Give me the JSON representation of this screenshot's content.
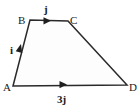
{
  "figure": {
    "background_color": "#ffffff",
    "stroke_color": "#2a2a2a",
    "fill_color": "#fdfdfd",
    "text_color": "#1b1b1b",
    "width": 140,
    "height": 105,
    "shape_type": "trapezium",
    "vertices": [
      {
        "id": "A",
        "label": "A",
        "x": 13,
        "y": 86,
        "label_x": 3,
        "label_y": 89
      },
      {
        "id": "B",
        "label": "B",
        "x": 30,
        "y": 20,
        "label_x": 18,
        "label_y": 22
      },
      {
        "id": "C",
        "label": "C",
        "x": 68,
        "y": 21,
        "label_x": 70,
        "label_y": 22
      },
      {
        "id": "D",
        "label": "D",
        "x": 127,
        "y": 85,
        "label_x": 129,
        "label_y": 89
      }
    ],
    "edges": [
      {
        "id": "AB",
        "from": "A",
        "to": "B",
        "vector_label": "i",
        "arrow": true,
        "label_x": 11,
        "label_y": 52
      },
      {
        "id": "BC",
        "from": "B",
        "to": "C",
        "vector_label": "j",
        "arrow": true,
        "label_x": 45,
        "label_y": 12
      },
      {
        "id": "CD",
        "from": "C",
        "to": "D",
        "vector_label": "",
        "arrow": false
      },
      {
        "id": "AD",
        "from": "A",
        "to": "D",
        "vector_label": "3j",
        "arrow": true,
        "label_x": 58,
        "label_y": 101
      }
    ],
    "arrow_markers": [
      {
        "id": "arrow-on-ab",
        "edge": "AB",
        "x": 20,
        "y": 49,
        "angle": -75
      },
      {
        "id": "arrow-on-bc",
        "edge": "BC",
        "x": 47,
        "y": 21,
        "angle": 0
      },
      {
        "id": "arrow-on-ad",
        "edge": "AD",
        "x": 63,
        "y": 84,
        "angle": 0
      }
    ],
    "path_outline": "M 13 86 L 30 20 L 68 21 L 127 85 Z"
  }
}
